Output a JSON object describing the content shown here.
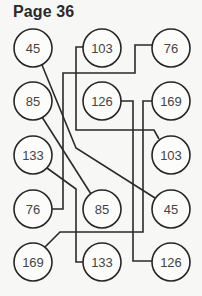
{
  "title": "Page 36",
  "colors": {
    "line": "#2a2a2a",
    "text": "#444444",
    "background": "#f7f7f5"
  },
  "nodes": {
    "left": [
      {
        "label": "45",
        "cx": 33,
        "cy": 48
      },
      {
        "label": "85",
        "cx": 33,
        "cy": 101
      },
      {
        "label": "133",
        "cx": 33,
        "cy": 155
      },
      {
        "label": "76",
        "cx": 33,
        "cy": 209
      },
      {
        "label": "169",
        "cx": 33,
        "cy": 262
      }
    ],
    "middle": [
      {
        "label": "103",
        "cx": 102,
        "cy": 48
      },
      {
        "label": "126",
        "cx": 102,
        "cy": 101
      },
      {
        "label": "85",
        "cx": 102,
        "cy": 209
      },
      {
        "label": "133",
        "cx": 102,
        "cy": 262
      }
    ],
    "right": [
      {
        "label": "76",
        "cx": 171,
        "cy": 48
      },
      {
        "label": "169",
        "cx": 171,
        "cy": 101
      },
      {
        "label": "103",
        "cx": 171,
        "cy": 155
      },
      {
        "label": "45",
        "cx": 171,
        "cy": 209
      },
      {
        "label": "126",
        "cx": 171,
        "cy": 262
      }
    ]
  },
  "connections": [
    {
      "from": "left-45",
      "to": "right-45",
      "points": "42,65 76,148 155,198"
    },
    {
      "from": "left-85",
      "to": "middle-85",
      "points": "42,117 91,194"
    },
    {
      "from": "left-133",
      "to": "middle-133",
      "points": "47,168 76,189 76,262 83,262"
    },
    {
      "from": "left-76",
      "to": "right-76",
      "points": "52,209 63,209 63,73 135,73 135,45 152,45"
    },
    {
      "from": "left-169",
      "to": "right-169",
      "points": "45,247 60,232 143,232 143,101 152,101"
    },
    {
      "from": "middle-103",
      "to": "right-103",
      "points": "83,47 76,47 76,130 154,130 159,139"
    },
    {
      "from": "middle-126",
      "to": "right-126",
      "points": "121,101 133,101 133,261 152,261"
    }
  ]
}
